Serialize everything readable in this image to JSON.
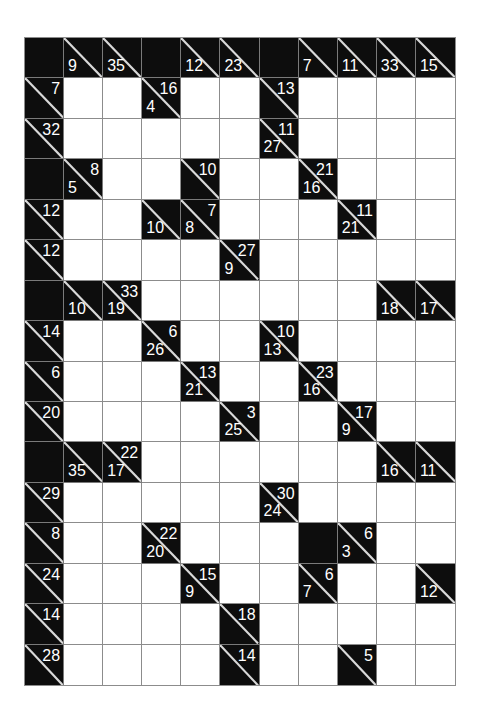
{
  "puzzle": {
    "type": "kakuro",
    "cols": 11,
    "rows": 16,
    "colors": {
      "block": "#0d0d0d",
      "white": "#ffffff",
      "grid_line": "#8c8c8c",
      "clue_text": "#ffffff"
    },
    "legend": "Each row is an array of cells. 'X' = solid black block; 'W' = empty white entry cell; {down, across} = clue cell with diagonal (down sum bottom-left, across sum top-right).",
    "grid": [
      [
        "X",
        {
          "down": "9"
        },
        {
          "down": "35"
        },
        "X",
        {
          "down": "12"
        },
        {
          "down": "23"
        },
        "X",
        {
          "down": "7"
        },
        {
          "down": "11"
        },
        {
          "down": "33"
        },
        {
          "down": "15"
        }
      ],
      [
        {
          "across": "7"
        },
        "W",
        "W",
        {
          "down": "4",
          "across": "16"
        },
        "W",
        "W",
        {
          "across": "13"
        },
        "W",
        "W",
        "W",
        "W"
      ],
      [
        {
          "across": "32"
        },
        "W",
        "W",
        "W",
        "W",
        "W",
        {
          "down": "27",
          "across": "11"
        },
        "W",
        "W",
        "W",
        "W"
      ],
      [
        "X",
        {
          "down": "5",
          "across": "8"
        },
        "W",
        "W",
        {
          "across": "10"
        },
        "W",
        "W",
        {
          "down": "16",
          "across": "21"
        },
        "W",
        "W",
        "W"
      ],
      [
        {
          "across": "12"
        },
        "W",
        "W",
        {
          "down": "10"
        },
        {
          "down": "8",
          "across": "7"
        },
        "W",
        "W",
        "W",
        {
          "down": "21",
          "across": "11"
        },
        "W",
        "W"
      ],
      [
        {
          "across": "12"
        },
        "W",
        "W",
        "W",
        "W",
        {
          "down": "9",
          "across": "27"
        },
        "W",
        "W",
        "W",
        "W",
        "W"
      ],
      [
        "X",
        {
          "down": "10"
        },
        {
          "down": "19",
          "across": "33"
        },
        "W",
        "W",
        "W",
        "W",
        "W",
        "W",
        {
          "down": "18"
        },
        {
          "down": "17"
        }
      ],
      [
        {
          "across": "14"
        },
        "W",
        "W",
        {
          "down": "26",
          "across": "6"
        },
        "W",
        "W",
        {
          "down": "13",
          "across": "10"
        },
        "W",
        "W",
        "W",
        "W"
      ],
      [
        {
          "across": "6"
        },
        "W",
        "W",
        "W",
        {
          "down": "21",
          "across": "13"
        },
        "W",
        "W",
        {
          "down": "16",
          "across": "23"
        },
        "W",
        "W",
        "W"
      ],
      [
        {
          "across": "20"
        },
        "W",
        "W",
        "W",
        "W",
        {
          "down": "25",
          "across": "3"
        },
        "W",
        "W",
        {
          "down": "9",
          "across": "17"
        },
        "W",
        "W"
      ],
      [
        "X",
        {
          "down": "35"
        },
        {
          "down": "17",
          "across": "22"
        },
        "W",
        "W",
        "W",
        "W",
        "W",
        "W",
        {
          "down": "16"
        },
        {
          "down": "11"
        }
      ],
      [
        {
          "across": "29"
        },
        "W",
        "W",
        "W",
        "W",
        "W",
        {
          "down": "24",
          "across": "30"
        },
        "W",
        "W",
        "W",
        "W"
      ],
      [
        {
          "across": "8"
        },
        "W",
        "W",
        {
          "down": "20",
          "across": "22"
        },
        "W",
        "W",
        "W",
        "X",
        {
          "down": "3",
          "across": "6"
        },
        "W",
        "W"
      ],
      [
        {
          "across": "24"
        },
        "W",
        "W",
        "W",
        {
          "down": "9",
          "across": "15"
        },
        "W",
        "W",
        {
          "down": "7",
          "across": "6"
        },
        "W",
        "W",
        {
          "down": "12"
        }
      ],
      [
        {
          "across": "14"
        },
        "W",
        "W",
        "W",
        "W",
        {
          "across": "18"
        },
        "W",
        "W",
        "W",
        "W",
        "W"
      ],
      [
        {
          "across": "28"
        },
        "W",
        "W",
        "W",
        "W",
        {
          "across": "14"
        },
        "W",
        "W",
        {
          "across": "5"
        },
        "W",
        "W"
      ]
    ]
  }
}
